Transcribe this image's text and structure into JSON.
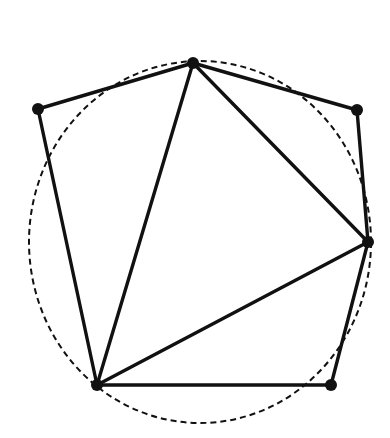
{
  "diagram": {
    "type": "polygon-with-circumscribed-curve",
    "colors": {
      "background": "#ffffff",
      "stroke": "#111111"
    },
    "vertices": [
      {
        "id": "A",
        "x": 38,
        "y": 109
      },
      {
        "id": "B",
        "x": 193,
        "y": 63
      },
      {
        "id": "C",
        "x": 357,
        "y": 110
      },
      {
        "id": "D",
        "x": 368,
        "y": 242
      },
      {
        "id": "E",
        "x": 331,
        "y": 385
      },
      {
        "id": "F",
        "x": 97,
        "y": 385
      }
    ],
    "polygon_edges": [
      [
        "A",
        "B"
      ],
      [
        "B",
        "C"
      ],
      [
        "C",
        "D"
      ],
      [
        "D",
        "E"
      ],
      [
        "E",
        "F"
      ],
      [
        "F",
        "A"
      ]
    ],
    "inner_triangle_edges": [
      [
        "F",
        "B"
      ],
      [
        "B",
        "D"
      ],
      [
        "D",
        "F"
      ]
    ],
    "dashed_circle": {
      "cx": 200,
      "cy": 242,
      "rx": 171,
      "ry": 181
    }
  }
}
